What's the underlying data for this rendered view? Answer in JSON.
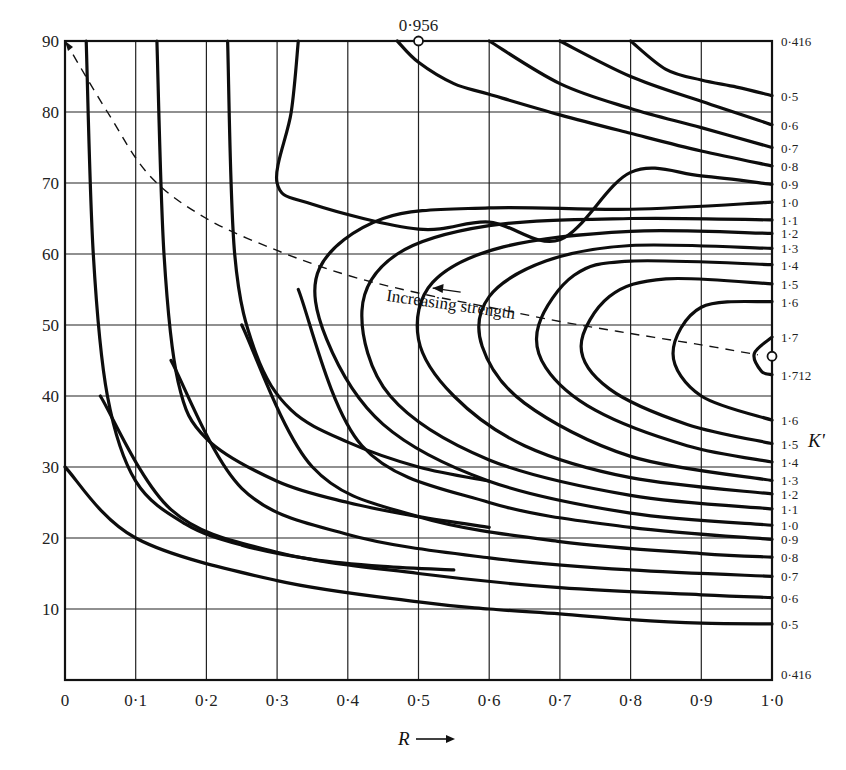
{
  "chart_data": {
    "type": "line",
    "subtype": "contour",
    "title": "",
    "xlabel": "R",
    "xlabel_arrow": "→",
    "ylabel": "",
    "right_axis_label": "K'",
    "xlim": [
      0,
      1.0
    ],
    "ylim": [
      0,
      90
    ],
    "grid": true,
    "x_ticks": [
      "0",
      "0·1",
      "0·2",
      "0·3",
      "0·4",
      "0·5",
      "0·6",
      "0·7",
      "0·8",
      "0·9",
      "1·0"
    ],
    "x_tick_values": [
      0,
      0.1,
      0.2,
      0.3,
      0.4,
      0.5,
      0.6,
      0.7,
      0.8,
      0.9,
      1.0
    ],
    "y_ticks": [
      "10",
      "20",
      "30",
      "40",
      "50",
      "60",
      "70",
      "80",
      "90"
    ],
    "y_tick_values": [
      10,
      20,
      30,
      40,
      50,
      60,
      70,
      80,
      90
    ],
    "right_labels": [
      {
        "text": "0·416",
        "y": 90
      },
      {
        "text": "0·5",
        "y": 82.3
      },
      {
        "text": "0·6",
        "y": 78.2
      },
      {
        "text": "0·7",
        "y": 75.0
      },
      {
        "text": "0·8",
        "y": 72.4
      },
      {
        "text": "0·9",
        "y": 69.8
      },
      {
        "text": "1·0",
        "y": 67.3
      },
      {
        "text": "1·1",
        "y": 64.8
      },
      {
        "text": "1·2",
        "y": 62.9
      },
      {
        "text": "1·3",
        "y": 60.8
      },
      {
        "text": "1·4",
        "y": 58.5
      },
      {
        "text": "1·5",
        "y": 55.8
      },
      {
        "text": "1·6",
        "y": 53.3
      },
      {
        "text": "1·7",
        "y": 48.3
      },
      {
        "text": "1·712",
        "y": 43.0
      },
      {
        "text": "1·6",
        "y": 36.6
      },
      {
        "text": "1·5",
        "y": 33.3
      },
      {
        "text": "1·4",
        "y": 30.7
      },
      {
        "text": "1·3",
        "y": 28.1
      },
      {
        "text": "1·2",
        "y": 26.2
      },
      {
        "text": "1·1",
        "y": 24.1
      },
      {
        "text": "1·0",
        "y": 21.8
      },
      {
        "text": "0·9",
        "y": 19.8
      },
      {
        "text": "0·8",
        "y": 17.3
      },
      {
        "text": "0·7",
        "y": 14.6
      },
      {
        "text": "0·6",
        "y": 11.6
      },
      {
        "text": "0·5",
        "y": 7.9
      },
      {
        "text": "0·416",
        "y": 0.8
      }
    ],
    "markers": [
      {
        "label": "0·956",
        "x": 0.5,
        "y": 90,
        "note": "top-edge value"
      },
      {
        "label": "K'",
        "x": 1.0,
        "y": 45.6,
        "value": "1·712",
        "note": "maximum"
      }
    ],
    "annotation": {
      "text": "Increasing strength",
      "x": 0.68,
      "y": 52,
      "rotation": 8
    },
    "ridge_line": {
      "style": "dashed",
      "points": [
        [
          0.0,
          90
        ],
        [
          0.06,
          80
        ],
        [
          0.12,
          71
        ],
        [
          0.2,
          65
        ],
        [
          0.3,
          60.5
        ],
        [
          0.4,
          57
        ],
        [
          0.5,
          54.5
        ],
        [
          0.6,
          52.5
        ],
        [
          0.7,
          50.5
        ],
        [
          0.8,
          48.8
        ],
        [
          0.9,
          47.2
        ],
        [
          0.98,
          45.8
        ]
      ],
      "arrow_at": [
        0.52,
        55.2
      ]
    },
    "series": [
      {
        "name": "contour-0.5",
        "points": [
          [
            0.8,
            90
          ],
          [
            0.85,
            86
          ],
          [
            0.9,
            84.5
          ],
          [
            0.95,
            83.5
          ],
          [
            1.0,
            82.3
          ]
        ]
      },
      {
        "name": "contour-0.6",
        "points": [
          [
            0.7,
            90
          ],
          [
            0.8,
            85
          ],
          [
            0.9,
            81.5
          ],
          [
            1.0,
            78.2
          ]
        ]
      },
      {
        "name": "contour-0.7",
        "points": [
          [
            0.6,
            90
          ],
          [
            0.7,
            84
          ],
          [
            0.8,
            80.5
          ],
          [
            0.9,
            77.8
          ],
          [
            1.0,
            75.0
          ]
        ]
      },
      {
        "name": "contour-0.8",
        "points": [
          [
            0.47,
            90
          ],
          [
            0.5,
            87
          ],
          [
            0.55,
            84
          ],
          [
            0.6,
            82.5
          ],
          [
            0.7,
            79.6
          ],
          [
            0.8,
            77
          ],
          [
            0.9,
            74.5
          ],
          [
            1.0,
            72.4
          ]
        ]
      },
      {
        "name": "contour-0.9",
        "points": [
          [
            0.33,
            90
          ],
          [
            0.32,
            80
          ],
          [
            0.3,
            70
          ],
          [
            0.35,
            67
          ],
          [
            0.5,
            63.5
          ],
          [
            0.6,
            64.5
          ],
          [
            0.7,
            62
          ],
          [
            0.8,
            71.5
          ],
          [
            0.9,
            71
          ],
          [
            1.0,
            69.8
          ]
        ]
      },
      {
        "name": "contour-left-0.045",
        "points": [
          [
            0.03,
            90
          ],
          [
            0.04,
            60
          ],
          [
            0.06,
            40
          ],
          [
            0.1,
            28
          ],
          [
            0.17,
            22
          ],
          [
            0.25,
            19
          ],
          [
            0.35,
            17
          ],
          [
            0.45,
            16
          ],
          [
            0.55,
            15.5
          ]
        ]
      },
      {
        "name": "contour-left-0.13",
        "points": [
          [
            0.13,
            90
          ],
          [
            0.14,
            60
          ],
          [
            0.16,
            42
          ],
          [
            0.2,
            34
          ],
          [
            0.3,
            28
          ],
          [
            0.4,
            25
          ],
          [
            0.5,
            23
          ],
          [
            0.6,
            21.5
          ]
        ]
      },
      {
        "name": "contour-left-0.23",
        "points": [
          [
            0.23,
            90
          ],
          [
            0.24,
            60
          ],
          [
            0.27,
            46
          ],
          [
            0.32,
            38
          ],
          [
            0.4,
            33.5
          ],
          [
            0.5,
            30
          ],
          [
            0.6,
            28
          ]
        ]
      },
      {
        "name": "contour-lower-0.5",
        "points": [
          [
            0.0,
            30
          ],
          [
            0.1,
            20
          ],
          [
            0.3,
            14
          ],
          [
            0.5,
            11
          ],
          [
            0.6,
            10
          ],
          [
            0.7,
            9.3
          ],
          [
            0.8,
            8.5
          ],
          [
            0.9,
            8.0
          ],
          [
            1.0,
            7.9
          ]
        ]
      },
      {
        "name": "contour-lower-0.6",
        "points": [
          [
            0.05,
            40
          ],
          [
            0.15,
            24
          ],
          [
            0.3,
            18
          ],
          [
            0.5,
            15
          ],
          [
            0.7,
            13
          ],
          [
            0.9,
            12
          ],
          [
            1.0,
            11.6
          ]
        ]
      },
      {
        "name": "contour-lower-0.7",
        "points": [
          [
            0.15,
            45
          ],
          [
            0.25,
            27
          ],
          [
            0.4,
            20.5
          ],
          [
            0.6,
            17.2
          ],
          [
            0.8,
            15.5
          ],
          [
            1.0,
            14.6
          ]
        ]
      },
      {
        "name": "contour-lower-0.8",
        "points": [
          [
            0.25,
            50
          ],
          [
            0.35,
            30
          ],
          [
            0.5,
            23
          ],
          [
            0.7,
            19.5
          ],
          [
            0.9,
            17.8
          ],
          [
            1.0,
            17.3
          ]
        ]
      },
      {
        "name": "contour-lower-0.9",
        "points": [
          [
            0.33,
            55
          ],
          [
            0.42,
            33
          ],
          [
            0.6,
            25
          ],
          [
            0.8,
            21.5
          ],
          [
            1.0,
            19.8
          ]
        ]
      },
      {
        "name": "contour-loop-1.0",
        "points": [
          [
            1.0,
            67.3
          ],
          [
            0.8,
            66.3
          ],
          [
            0.6,
            66.5
          ],
          [
            0.45,
            65
          ],
          [
            0.36,
            58
          ],
          [
            0.37,
            48
          ],
          [
            0.45,
            36
          ],
          [
            0.6,
            28
          ],
          [
            0.8,
            23.5
          ],
          [
            1.0,
            21.8
          ]
        ]
      },
      {
        "name": "contour-loop-1.1",
        "points": [
          [
            1.0,
            64.8
          ],
          [
            0.8,
            65
          ],
          [
            0.6,
            64
          ],
          [
            0.47,
            60
          ],
          [
            0.42,
            52
          ],
          [
            0.46,
            40
          ],
          [
            0.6,
            31
          ],
          [
            0.8,
            26
          ],
          [
            1.0,
            24.1
          ]
        ]
      },
      {
        "name": "contour-loop-1.2",
        "points": [
          [
            1.0,
            62.9
          ],
          [
            0.8,
            63.2
          ],
          [
            0.62,
            61
          ],
          [
            0.52,
            56
          ],
          [
            0.5,
            48
          ],
          [
            0.55,
            40
          ],
          [
            0.65,
            33
          ],
          [
            0.8,
            28.5
          ],
          [
            1.0,
            26.2
          ]
        ]
      },
      {
        "name": "contour-loop-1.3",
        "points": [
          [
            1.0,
            60.8
          ],
          [
            0.8,
            61.2
          ],
          [
            0.68,
            59
          ],
          [
            0.6,
            54
          ],
          [
            0.59,
            47
          ],
          [
            0.65,
            39
          ],
          [
            0.8,
            31.5
          ],
          [
            1.0,
            28.1
          ]
        ]
      },
      {
        "name": "contour-loop-1.4",
        "points": [
          [
            1.0,
            58.5
          ],
          [
            0.8,
            59
          ],
          [
            0.72,
            57
          ],
          [
            0.67,
            50
          ],
          [
            0.68,
            44
          ],
          [
            0.75,
            38
          ],
          [
            0.88,
            33
          ],
          [
            1.0,
            30.7
          ]
        ]
      },
      {
        "name": "contour-loop-1.5",
        "points": [
          [
            1.0,
            55.8
          ],
          [
            0.85,
            56.5
          ],
          [
            0.77,
            54
          ],
          [
            0.73,
            47
          ],
          [
            0.77,
            41
          ],
          [
            0.88,
            36
          ],
          [
            1.0,
            33.3
          ]
        ]
      },
      {
        "name": "contour-loop-1.6",
        "points": [
          [
            1.0,
            53.3
          ],
          [
            0.9,
            52.5
          ],
          [
            0.86,
            46
          ],
          [
            0.9,
            40
          ],
          [
            1.0,
            36.6
          ]
        ]
      },
      {
        "name": "contour-loop-1.7",
        "points": [
          [
            1.0,
            48.3
          ],
          [
            0.975,
            46
          ],
          [
            0.985,
            43.5
          ],
          [
            1.0,
            43
          ]
        ]
      }
    ]
  },
  "plot_geometry_hint": {
    "left_px": 65,
    "right_px": 772,
    "top_px": 41,
    "bottom_px": 680
  }
}
